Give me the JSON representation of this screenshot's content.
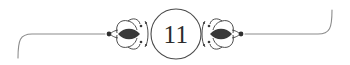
{
  "page": {
    "number": "11",
    "background_color": "#ffffff",
    "rule_color": "#8c8c8c",
    "ornament_color": "#3a3a3a",
    "number_color": "#2b2b2b",
    "circle_color": "#4a4a4a"
  },
  "ornament": {
    "name": "page-number-divider",
    "left_flourish_label": "left-vine-flourish",
    "right_flourish_label": "right-vine-flourish",
    "left_terminal_dot_label": "left-terminal-dot",
    "right_terminal_dot_label": "right-terminal-dot",
    "left_hook_label": "left-hooked-rule",
    "right_hook_label": "right-hooked-rule",
    "circle_label": "page-number-circle"
  }
}
